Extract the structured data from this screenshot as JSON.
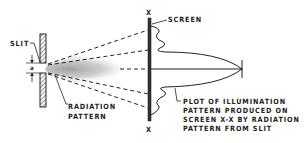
{
  "diagram": {
    "labels": {
      "slit": "SLIT",
      "dimension": "a",
      "radiation_pattern_line1": "RADIATION",
      "radiation_pattern_line2": "PATTERN",
      "screen": "SCREEN",
      "x_top": "X",
      "x_bottom": "X",
      "plot_line1": "PLOT OF ILLUMINATION",
      "plot_line2": "PATTERN PRODUCED ON",
      "plot_line3": "SCREEN X-X BY RADIATION",
      "plot_line4": "PATTERN FROM SLIT"
    },
    "colors": {
      "ink": "#222222",
      "glow": "#b8b8b8",
      "background": "#ffffff"
    }
  }
}
